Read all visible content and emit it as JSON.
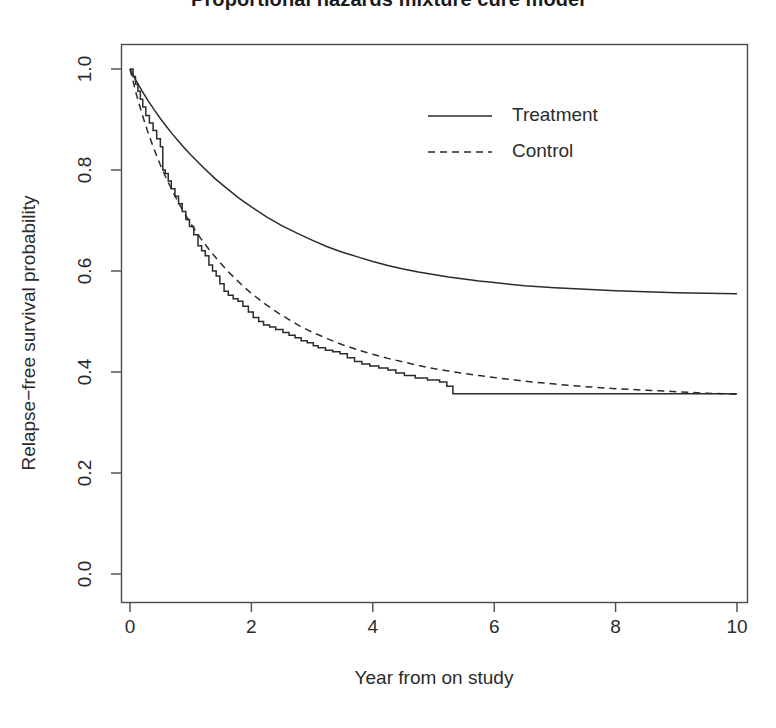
{
  "chart_data": {
    "type": "line",
    "title": "Proportional hazards mixture cure model",
    "xlabel": "Year from on study",
    "ylabel": "Relapse−free survival probability",
    "xlim": [
      0,
      10
    ],
    "ylim": [
      0,
      1
    ],
    "xticks": [
      "0",
      "2",
      "4",
      "6",
      "8",
      "10"
    ],
    "xtick_values": [
      0,
      2,
      4,
      6,
      8,
      10
    ],
    "yticks": [
      "0.0",
      "0.2",
      "0.4",
      "0.6",
      "0.8",
      "1.0"
    ],
    "ytick_values": [
      0.0,
      0.2,
      0.4,
      0.6,
      0.8,
      1.0
    ],
    "grid": false,
    "legend_position": "top-center-right",
    "legend": [
      {
        "label": "Treatment",
        "style": "solid"
      },
      {
        "label": "Control",
        "style": "dashed"
      }
    ],
    "series": [
      {
        "name": "Treatment",
        "style": "solid",
        "cure_fraction": 0.553,
        "points": [
          [
            0.0,
            1.0
          ],
          [
            0.1,
            0.977
          ],
          [
            0.2,
            0.956
          ],
          [
            0.3,
            0.937
          ],
          [
            0.4,
            0.919
          ],
          [
            0.5,
            0.902
          ],
          [
            0.6,
            0.886
          ],
          [
            0.7,
            0.871
          ],
          [
            0.8,
            0.857
          ],
          [
            0.9,
            0.843
          ],
          [
            1.0,
            0.83
          ],
          [
            1.2,
            0.806
          ],
          [
            1.4,
            0.783
          ],
          [
            1.6,
            0.763
          ],
          [
            1.8,
            0.744
          ],
          [
            2.0,
            0.727
          ],
          [
            2.25,
            0.707
          ],
          [
            2.5,
            0.69
          ],
          [
            2.75,
            0.675
          ],
          [
            3.0,
            0.661
          ],
          [
            3.25,
            0.648
          ],
          [
            3.5,
            0.637
          ],
          [
            3.75,
            0.628
          ],
          [
            4.0,
            0.619
          ],
          [
            4.25,
            0.611
          ],
          [
            4.5,
            0.604
          ],
          [
            4.75,
            0.598
          ],
          [
            5.0,
            0.593
          ],
          [
            5.25,
            0.588
          ],
          [
            5.5,
            0.584
          ],
          [
            5.75,
            0.58
          ],
          [
            6.0,
            0.577
          ],
          [
            6.25,
            0.574
          ],
          [
            6.5,
            0.571
          ],
          [
            6.75,
            0.569
          ],
          [
            7.0,
            0.567
          ],
          [
            7.5,
            0.564
          ],
          [
            8.0,
            0.561
          ],
          [
            8.5,
            0.559
          ],
          [
            9.0,
            0.557
          ],
          [
            9.5,
            0.556
          ],
          [
            10.0,
            0.555
          ]
        ]
      },
      {
        "name": "Control",
        "style": "dashed",
        "cure_fraction": 0.355,
        "points": [
          [
            0.0,
            1.0
          ],
          [
            0.1,
            0.952
          ],
          [
            0.2,
            0.91
          ],
          [
            0.3,
            0.873
          ],
          [
            0.4,
            0.84
          ],
          [
            0.5,
            0.81
          ],
          [
            0.6,
            0.783
          ],
          [
            0.7,
            0.758
          ],
          [
            0.8,
            0.735
          ],
          [
            0.9,
            0.714
          ],
          [
            1.0,
            0.694
          ],
          [
            1.15,
            0.667
          ],
          [
            1.3,
            0.643
          ],
          [
            1.45,
            0.621
          ],
          [
            1.6,
            0.601
          ],
          [
            1.75,
            0.583
          ],
          [
            1.9,
            0.566
          ],
          [
            2.05,
            0.551
          ],
          [
            2.2,
            0.537
          ],
          [
            2.4,
            0.52
          ],
          [
            2.6,
            0.505
          ],
          [
            2.8,
            0.491
          ],
          [
            3.0,
            0.479
          ],
          [
            3.25,
            0.466
          ],
          [
            3.5,
            0.454
          ],
          [
            3.75,
            0.444
          ],
          [
            4.0,
            0.435
          ],
          [
            4.25,
            0.427
          ],
          [
            4.5,
            0.42
          ],
          [
            4.75,
            0.413
          ],
          [
            5.0,
            0.407
          ],
          [
            5.25,
            0.402
          ],
          [
            5.5,
            0.397
          ],
          [
            5.75,
            0.393
          ],
          [
            6.0,
            0.389
          ],
          [
            6.5,
            0.382
          ],
          [
            7.0,
            0.376
          ],
          [
            7.5,
            0.371
          ],
          [
            8.0,
            0.367
          ],
          [
            8.5,
            0.364
          ],
          [
            9.0,
            0.361
          ],
          [
            9.5,
            0.358
          ],
          [
            10.0,
            0.356
          ]
        ]
      },
      {
        "name": "Kaplan-Meier estimate",
        "style": "step",
        "plateau": 0.357,
        "points": [
          [
            0.0,
            1.0
          ],
          [
            0.05,
            0.985
          ],
          [
            0.09,
            0.97
          ],
          [
            0.13,
            0.956
          ],
          [
            0.17,
            0.94
          ],
          [
            0.21,
            0.925
          ],
          [
            0.26,
            0.908
          ],
          [
            0.32,
            0.893
          ],
          [
            0.38,
            0.878
          ],
          [
            0.44,
            0.862
          ],
          [
            0.5,
            0.846
          ],
          [
            0.54,
            0.8
          ],
          [
            0.58,
            0.793
          ],
          [
            0.63,
            0.778
          ],
          [
            0.68,
            0.763
          ],
          [
            0.74,
            0.748
          ],
          [
            0.8,
            0.733
          ],
          [
            0.86,
            0.718
          ],
          [
            0.92,
            0.702
          ],
          [
            0.98,
            0.688
          ],
          [
            1.05,
            0.672
          ],
          [
            1.12,
            0.65
          ],
          [
            1.18,
            0.64
          ],
          [
            1.24,
            0.63
          ],
          [
            1.3,
            0.612
          ],
          [
            1.36,
            0.6
          ],
          [
            1.42,
            0.59
          ],
          [
            1.48,
            0.575
          ],
          [
            1.55,
            0.56
          ],
          [
            1.62,
            0.552
          ],
          [
            1.7,
            0.545
          ],
          [
            1.78,
            0.54
          ],
          [
            1.86,
            0.53
          ],
          [
            1.95,
            0.519
          ],
          [
            2.03,
            0.508
          ],
          [
            2.12,
            0.5
          ],
          [
            2.2,
            0.493
          ],
          [
            2.3,
            0.489
          ],
          [
            2.4,
            0.484
          ],
          [
            2.52,
            0.478
          ],
          [
            2.62,
            0.473
          ],
          [
            2.72,
            0.468
          ],
          [
            2.82,
            0.462
          ],
          [
            2.92,
            0.458
          ],
          [
            3.02,
            0.452
          ],
          [
            3.1,
            0.448
          ],
          [
            3.22,
            0.443
          ],
          [
            3.34,
            0.44
          ],
          [
            3.46,
            0.436
          ],
          [
            3.58,
            0.428
          ],
          [
            3.7,
            0.421
          ],
          [
            3.82,
            0.416
          ],
          [
            3.95,
            0.412
          ],
          [
            4.1,
            0.408
          ],
          [
            4.25,
            0.404
          ],
          [
            4.38,
            0.398
          ],
          [
            4.52,
            0.393
          ],
          [
            4.7,
            0.388
          ],
          [
            4.9,
            0.384
          ],
          [
            5.1,
            0.38
          ],
          [
            5.22,
            0.372
          ],
          [
            5.32,
            0.357
          ],
          [
            10.0,
            0.357
          ]
        ]
      }
    ]
  },
  "axis": {
    "plot_left_px": 121,
    "plot_right_px": 747,
    "plot_top_px": 44,
    "plot_bottom_px": 602,
    "x_zero_px": 130,
    "x_max_px": 737,
    "y_zero_px": 574,
    "y_one_px": 69
  },
  "legend": {
    "treatment_label": "Treatment",
    "control_label": "Control",
    "swatch_x_px": 428,
    "swatch_x2_px": 492,
    "treatment_y_px": 116,
    "control_y_px": 152,
    "text_x_px": 512
  },
  "colors": {
    "line": "#2b2b2b",
    "axis": "#4a4a4a",
    "text": "#2b2b2b",
    "title": "#1b1b1b",
    "background": "#ffffff"
  }
}
